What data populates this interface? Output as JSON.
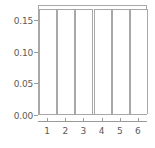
{
  "chart_data": {
    "type": "bar",
    "title": "",
    "subtitle": "",
    "xlabel": "",
    "ylabel": "",
    "categories": [
      "1",
      "2",
      "3",
      "4",
      "5",
      "6"
    ],
    "values": [
      0.1667,
      0.1667,
      0.1677,
      0.1667,
      0.1667,
      0.1667
    ],
    "series": [
      {
        "name": "density",
        "values": [
          0.1667,
          0.1667,
          0.1677,
          0.1667,
          0.1667,
          0.1667
        ]
      }
    ],
    "ylim": [
      0.0,
      0.175
    ],
    "xlim": [
      0.5,
      6.5
    ],
    "ytick_labels": [
      "0.00",
      "0.05",
      "0.10",
      "0.15"
    ],
    "ytick_values": [
      0.0,
      0.05,
      0.1,
      0.15
    ],
    "xtick_labels": [
      "1",
      "2",
      "3",
      "4",
      "5",
      "6"
    ],
    "grid": false,
    "legend": null,
    "annotations": [],
    "bar_fill_color": "#ffffff",
    "bar_edge_color": "#a8a8a8",
    "axis_color": "#9a9a9a",
    "tick_label_color": "#5a5a5a",
    "background_color": "#ffffff"
  }
}
